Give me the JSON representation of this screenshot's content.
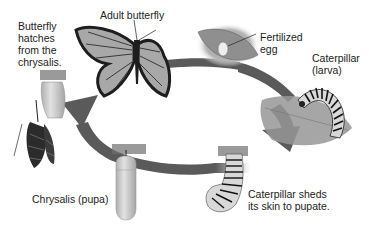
{
  "diagram": {
    "stages": [
      {
        "id": "adult",
        "label": "Adult butterfly"
      },
      {
        "id": "egg",
        "label": "Fertilized\negg"
      },
      {
        "id": "larva",
        "label": "Caterpillar\n(larva)"
      },
      {
        "id": "shed",
        "label": "Caterpillar sheds\nits skin to pupate."
      },
      {
        "id": "pupa",
        "label": "Chrysalis (pupa)"
      },
      {
        "id": "hatch",
        "label": "Butterfly\nhatches\nfrom the\nchrysalis."
      }
    ],
    "cycle_direction": "clockwise",
    "colors": {
      "arrow": "#5a5a5a",
      "wing": "#a8a8a8",
      "wing_border": "#1e1e1e",
      "chrysalis": "#c8c8c8",
      "leaf": "#8c8c8c",
      "text": "#222222"
    }
  }
}
